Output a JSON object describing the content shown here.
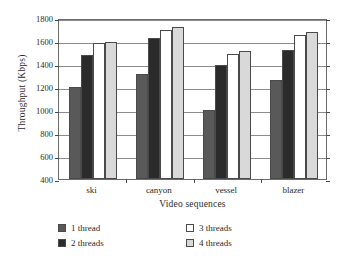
{
  "chart_data": {
    "type": "bar",
    "title": "",
    "xlabel": "Video sequences",
    "ylabel": "Throughput (Kbps)",
    "categories": [
      "ski",
      "canyon",
      "vessel",
      "blazer"
    ],
    "ylim": [
      400,
      1800
    ],
    "yticks": [
      400,
      600,
      800,
      1000,
      1200,
      1400,
      1600,
      1800
    ],
    "ytick_labels": [
      "400",
      "600",
      "800",
      "1000",
      "1200",
      "1400",
      "1600",
      "1800"
    ],
    "grid": true,
    "legend_position": "below-axes",
    "series": [
      {
        "name": "1 thread",
        "color": "#595959",
        "values": [
          1200,
          1310,
          1000,
          1260
        ]
      },
      {
        "name": "2 threads",
        "color": "#2b2b2b",
        "values": [
          1480,
          1625,
          1395,
          1525
        ]
      },
      {
        "name": "3 threads",
        "color": "#ffffff",
        "values": [
          1580,
          1700,
          1490,
          1655
        ]
      },
      {
        "name": "4 threads",
        "color": "#d9d9d9",
        "values": [
          1595,
          1720,
          1510,
          1675
        ]
      }
    ]
  },
  "legend": {
    "items": [
      {
        "label": "1 thread"
      },
      {
        "label": "3 threads"
      },
      {
        "label": "2 threads"
      },
      {
        "label": "4 threads"
      }
    ]
  }
}
